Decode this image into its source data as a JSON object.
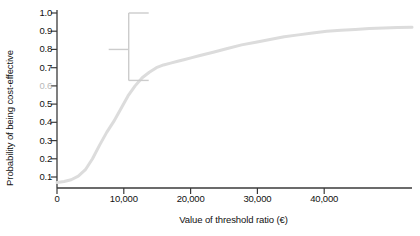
{
  "chart_data": {
    "type": "line",
    "title": "",
    "xlabel": "Value of threshold ratio (€)",
    "ylabel": "Probability of being cost-effective",
    "xlim": [
      0,
      50000
    ],
    "ylim": [
      0.0,
      1.02
    ],
    "grid": false,
    "legend": "none",
    "x_ticks": [
      0,
      10000,
      20000,
      30000,
      40000
    ],
    "x_tick_labels": [
      "0",
      "10,000",
      "20,000",
      "30,000",
      "40,000"
    ],
    "y_ticks": [
      0.1,
      0.2,
      0.3,
      0.4,
      0.5,
      0.6,
      0.7,
      0.8,
      0.9,
      1.0
    ],
    "y_tick_labels": [
      "0.1",
      "0.2",
      "0.3",
      "0.4",
      "0.5",
      "0.6",
      "0.7",
      "0.8",
      "0.9",
      "1.0"
    ],
    "series": [
      {
        "name": "Cost-effectiveness acceptability curve",
        "color": "#dcdcdc",
        "line_width": 3,
        "x": [
          0,
          1000,
          2000,
          3000,
          4000,
          5000,
          6000,
          7000,
          8000,
          9000,
          10000,
          11000,
          12000,
          13000,
          14000,
          15000,
          16000,
          17000,
          18000,
          19000,
          20000,
          22000,
          24000,
          26000,
          28000,
          30000,
          32000,
          34000,
          36000,
          38000,
          40000,
          42000,
          44000,
          46000,
          48000,
          50000
        ],
        "y": [
          0.07,
          0.075,
          0.085,
          0.105,
          0.14,
          0.2,
          0.275,
          0.345,
          0.405,
          0.475,
          0.545,
          0.6,
          0.645,
          0.675,
          0.7,
          0.715,
          0.725,
          0.735,
          0.745,
          0.755,
          0.765,
          0.785,
          0.805,
          0.825,
          0.84,
          0.855,
          0.87,
          0.88,
          0.89,
          0.9,
          0.905,
          0.91,
          0.915,
          0.918,
          0.92,
          0.922
        ]
      }
    ],
    "annotations": [
      {
        "name": "interval-bracket",
        "shape": "bracket",
        "color": "#cccccc",
        "x": 10100,
        "y_upper": 1.0,
        "y_lower": 0.63,
        "y_center": 0.8,
        "arm_direction": "right",
        "center_tick_direction": "left"
      }
    ]
  }
}
